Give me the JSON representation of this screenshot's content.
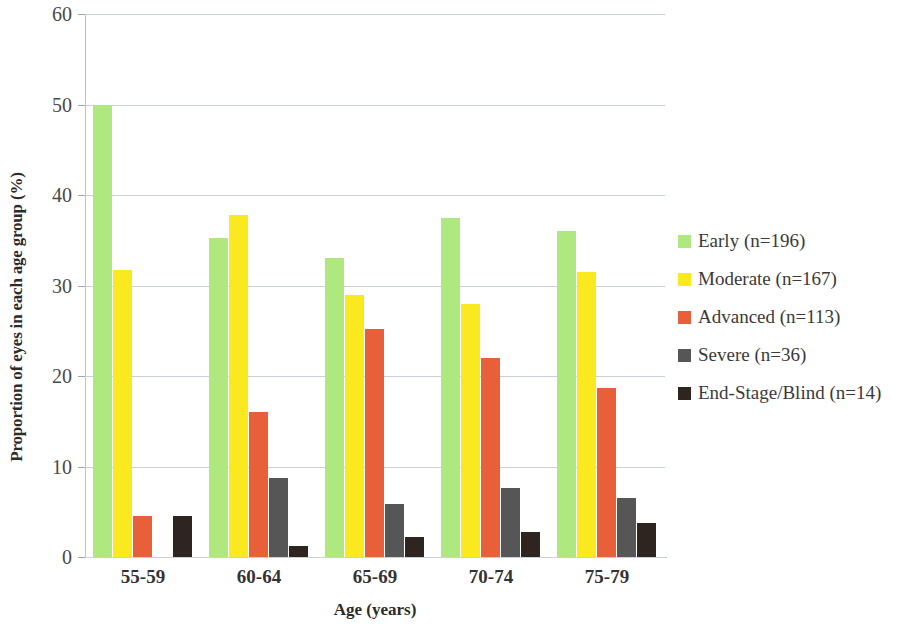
{
  "chart_data": {
    "type": "bar",
    "title": "",
    "xlabel": "Age (years)",
    "ylabel": "Proportion of eyes in each age group (%)",
    "ylim": [
      0,
      60
    ],
    "yticks": [
      0,
      10,
      20,
      30,
      40,
      50,
      60
    ],
    "grid": true,
    "legend_position": "right",
    "categories": [
      "55-59",
      "60-64",
      "65-69",
      "70-74",
      "75-79"
    ],
    "series": [
      {
        "name": "Early (n=196)",
        "color": "#AEE87E",
        "values": [
          50.0,
          35.3,
          33.0,
          37.5,
          36.0
        ]
      },
      {
        "name": "Moderate (n=167)",
        "color": "#FBE91F",
        "values": [
          31.7,
          37.8,
          29.0,
          28.0,
          31.5
        ]
      },
      {
        "name": "Advanced (n=113)",
        "color": "#E8603A",
        "values": [
          4.5,
          16.0,
          25.2,
          22.0,
          18.7
        ]
      },
      {
        "name": "Severe (n=36)",
        "color": "#565656",
        "values": [
          0.0,
          8.7,
          5.9,
          7.6,
          6.5
        ]
      },
      {
        "name": "End-Stage/Blind (n=14)",
        "color": "#2E2420",
        "values": [
          4.5,
          1.2,
          2.2,
          2.8,
          3.8
        ]
      }
    ]
  },
  "axes": {
    "y_tick_labels": [
      "0",
      "10",
      "20",
      "30",
      "40",
      "50",
      "60"
    ],
    "x_tick_labels": [
      "55-59",
      "60-64",
      "65-69",
      "70-74",
      "75-79"
    ],
    "x_title": "Age (years)",
    "y_title": "Proportion of eyes in each age group (%)"
  },
  "legend": {
    "items": [
      {
        "label": "Early (n=196)",
        "color": "#AEE87E"
      },
      {
        "label": "Moderate (n=167)",
        "color": "#FBE91F"
      },
      {
        "label": "Advanced (n=113)",
        "color": "#E8603A"
      },
      {
        "label": "Severe (n=36)",
        "color": "#565656"
      },
      {
        "label": "End-Stage/Blind (n=14)",
        "color": "#2E2420"
      }
    ]
  }
}
